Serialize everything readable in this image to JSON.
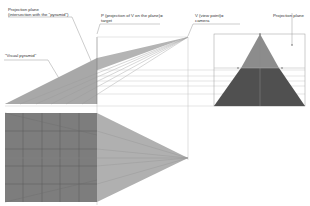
{
  "labels": {
    "projection_plane_left_line1": "Projection plane",
    "projection_plane_left_line2": "(intersection with the \"pyramid\")",
    "p_line1": "P (projection of V on the plane)=",
    "p_line2": "target",
    "v_line1": "V (view point)=",
    "v_line2": "camera",
    "projection_plane_right": "Projection plane",
    "visual_pyramid": "\"Visual pyramid\""
  },
  "colors": {
    "background": "#ffffff",
    "light_gray": "#b4b4b4",
    "mid_gray": "#8c8c8c",
    "dark_gray": "#555555",
    "grid_square": "#7a7a7a",
    "lines": "#9a9a9a",
    "text": "#333333"
  }
}
